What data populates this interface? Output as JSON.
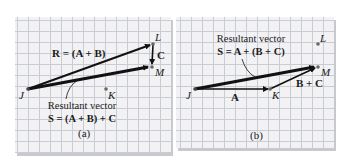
{
  "figure": {
    "panel_a": {
      "caption": "(a)",
      "points": {
        "J": "J",
        "K": "K",
        "L": "L",
        "M": "M"
      },
      "vector_R_label": "R = (A + B)",
      "vector_C_label": "C",
      "resultant_title": "Resultant vector",
      "resultant_formula": "S = (A + B) + C"
    },
    "panel_b": {
      "caption": "(b)",
      "points": {
        "J": "J",
        "K": "K",
        "L": "L",
        "M": "M"
      },
      "vector_A_label": "A",
      "vector_BC_label": "B + C",
      "resultant_title": "Resultant vector",
      "resultant_formula": "S = A + (B + C)"
    },
    "colors": {
      "grid_background": "#f2f2f4",
      "grid_lines": "#c9ccd3",
      "vector": "#111111",
      "point": "#666666"
    }
  }
}
